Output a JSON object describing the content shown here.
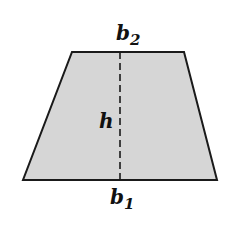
{
  "diagram": {
    "type": "trapezoid",
    "fill_color": "#d6d6d6",
    "stroke_color": "#1a1a1a",
    "vertices": {
      "top_left": [
        72,
        52
      ],
      "top_right": [
        184,
        52
      ],
      "bottom_right": [
        217,
        180
      ],
      "bottom_left": [
        23,
        180
      ]
    },
    "height_line": {
      "x": 120,
      "y1": 52,
      "y2": 180,
      "style": "dashed"
    },
    "labels": {
      "top_base": {
        "var": "b",
        "sub": "2"
      },
      "bottom_base": {
        "var": "b",
        "sub": "1"
      },
      "height": {
        "var": "h"
      }
    }
  }
}
